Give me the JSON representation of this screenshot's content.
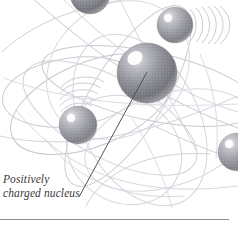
{
  "figure": {
    "kind": "atom-illustration",
    "background_color": "#ffffff"
  },
  "annotation": {
    "label_line_1": "Positively",
    "label_line_2": "charged nucleus",
    "label_full": "Positively\ncharged nucleus",
    "leader_line": {
      "from_x": 79,
      "from_y": 197,
      "to_x": 147,
      "to_y": 72,
      "color": "#4a4a52"
    }
  },
  "colors": {
    "sphere_dark": "#6e6e74",
    "sphere_mid": "#909096",
    "sphere_light": "#c9c9cf",
    "sphere_highlight": "#ffffff",
    "orbit_line": "#c4c4cc",
    "orbit_line_faint": "#dcdce2",
    "trail_line": "#cfcfd6",
    "rule_line": "#8d8d93",
    "caption_text": "#3a3a3a"
  },
  "nucleus": {
    "name": "positively-charged-nucleus",
    "cx": 147,
    "cy": 73,
    "r": 30,
    "highlight_cx": 135,
    "highlight_cy": 58,
    "highlight_r": 7
  },
  "electrons": [
    {
      "name": "electron-top-left",
      "cx": 90,
      "cy": -6,
      "r": 20,
      "highlight_dx": -7,
      "highlight_dy": -8,
      "highlight_r": 4.5
    },
    {
      "name": "electron-top-right",
      "cx": 175,
      "cy": 25,
      "r": 18,
      "highlight_dx": -7,
      "highlight_dy": -7,
      "highlight_r": 4.2
    },
    {
      "name": "electron-left-middle",
      "cx": 78,
      "cy": 125,
      "r": 19,
      "highlight_dx": -7,
      "highlight_dy": -7,
      "highlight_r": 4.2
    },
    {
      "name": "electron-right-edge",
      "cx": 237,
      "cy": 152,
      "r": 19,
      "highlight_dx": -8,
      "highlight_dy": -8,
      "highlight_r": 4.2
    }
  ],
  "motion_trails": [
    {
      "name": "motion-trail-top-right",
      "arcs": 6
    },
    {
      "name": "motion-trail-left",
      "arcs": 5
    }
  ],
  "orbits": {
    "count": 9,
    "style": "overlapping-ellipses"
  },
  "divider": {
    "name": "bottom-rule",
    "y": 219,
    "x_start": 0,
    "x_end": 229
  }
}
